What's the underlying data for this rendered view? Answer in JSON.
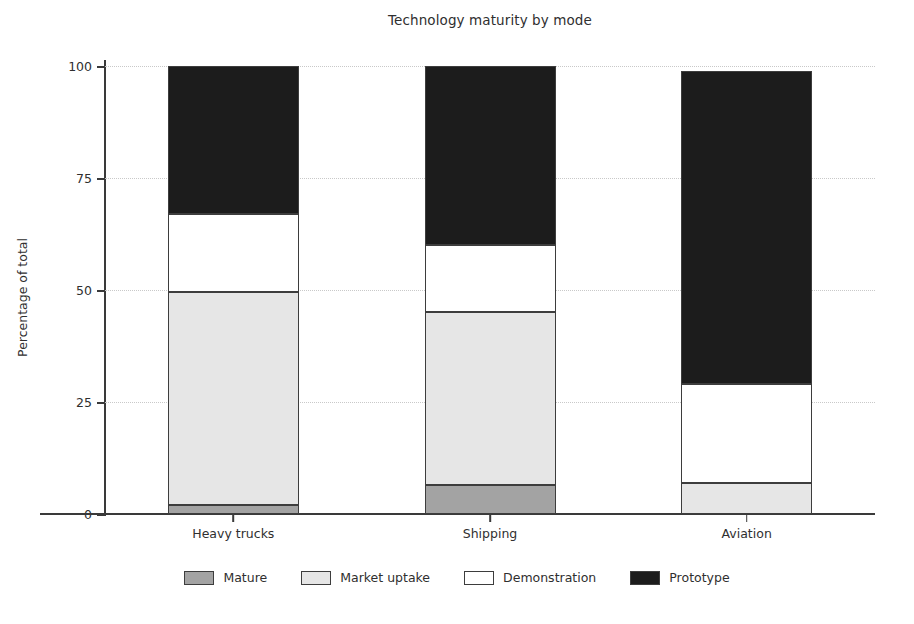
{
  "chart_data": {
    "type": "bar",
    "subtype": "stacked-bar-100",
    "title": "Technology maturity by mode",
    "xlabel": "",
    "ylabel": "Percentage of total",
    "ylim": [
      0,
      105
    ],
    "yticks": [
      0,
      25,
      50,
      75,
      100
    ],
    "ytick_labels": [
      "0",
      "25",
      "50",
      "75",
      "100"
    ],
    "grid": true,
    "grid_axis": "y",
    "legend_position": "bottom",
    "categories": [
      "Heavy trucks",
      "Shipping",
      "Aviation"
    ],
    "series": [
      {
        "name": "Mature",
        "color": "#a3a3a3",
        "values": [
          2,
          6.5,
          0
        ]
      },
      {
        "name": "Market uptake",
        "color": "#e6e6e6",
        "values": [
          47.5,
          38.5,
          7
        ]
      },
      {
        "name": "Demonstration",
        "color": "#ffffff",
        "values": [
          17.5,
          15,
          22
        ]
      },
      {
        "name": "Prototype",
        "color": "#1c1c1c",
        "values": [
          33,
          40,
          70
        ]
      }
    ],
    "totals": [
      100,
      100,
      99
    ]
  },
  "legend": {
    "items": [
      {
        "label": "Mature",
        "swatch": "legend-swatch-mature"
      },
      {
        "label": "Market uptake",
        "swatch": "legend-swatch-market-uptake"
      },
      {
        "label": "Demonstration",
        "swatch": "legend-swatch-demonstration"
      },
      {
        "label": "Prototype",
        "swatch": "legend-swatch-prototype"
      }
    ]
  },
  "colors": {
    "background": "#ffffff",
    "axis": "#3a3a3a",
    "grid": "#c9c9c9",
    "text": "#2f2f2f",
    "bar_edge": "#3d3d3d"
  }
}
